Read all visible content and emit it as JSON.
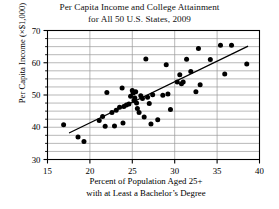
{
  "chart_data": {
    "type": "scatter",
    "title": "Per Capita Income and College Attainment for All 50 U.S. States, 2009",
    "title_line1": "Per Capita Income and College Attainment",
    "title_line2": "for All 50 U.S. States, 2009",
    "xlabel": "Percent of Population Aged 25+ with at Least a Bachelor's Degree",
    "xlabel_line1": "Percent of Population Aged 25+",
    "xlabel_line2": "with at Least a Bachelor’s Degree",
    "ylabel": "Per Capita Income (×$1,000)",
    "xlim": [
      15,
      40
    ],
    "ylim": [
      30,
      70
    ],
    "xticks": [
      15,
      20,
      25,
      30,
      35,
      40
    ],
    "yticks": [
      30,
      40,
      50,
      60,
      70
    ],
    "y_minor_ticks": [
      32.5,
      35,
      37.5,
      42.5,
      45,
      47.5,
      52.5,
      55,
      57.5,
      62.5,
      65,
      67.5
    ],
    "grid": "horizontal-minor-and-major plus vertical at major x ticks",
    "legend": "none",
    "marker": "filled-circle",
    "marker_color": "#000000",
    "frame_color": "#000000",
    "grid_color": "#9a9a9a",
    "points": [
      [
        16.9,
        40.8
      ],
      [
        18.6,
        37.0
      ],
      [
        19.3,
        35.6
      ],
      [
        21.1,
        42.1
      ],
      [
        21.5,
        43.3
      ],
      [
        21.8,
        40.3
      ],
      [
        22.0,
        50.8
      ],
      [
        22.6,
        44.6
      ],
      [
        22.9,
        40.4
      ],
      [
        23.1,
        45.3
      ],
      [
        23.5,
        46.2
      ],
      [
        23.8,
        52.2
      ],
      [
        23.9,
        41.3
      ],
      [
        24.0,
        46.4
      ],
      [
        24.3,
        46.9
      ],
      [
        24.6,
        47.2
      ],
      [
        24.8,
        49.6
      ],
      [
        25.0,
        51.4
      ],
      [
        25.1,
        50.6
      ],
      [
        25.2,
        48.3
      ],
      [
        25.3,
        49.1
      ],
      [
        25.4,
        51.0
      ],
      [
        25.5,
        47.5
      ],
      [
        25.6,
        45.8
      ],
      [
        25.8,
        44.6
      ],
      [
        26.0,
        49.8
      ],
      [
        26.2,
        48.9
      ],
      [
        26.4,
        43.2
      ],
      [
        26.6,
        61.2
      ],
      [
        26.8,
        49.3
      ],
      [
        27.0,
        47.4
      ],
      [
        27.2,
        41.0
      ],
      [
        27.4,
        50.1
      ],
      [
        28.0,
        42.3
      ],
      [
        28.6,
        49.9
      ],
      [
        29.0,
        59.4
      ],
      [
        29.2,
        50.3
      ],
      [
        29.5,
        45.5
      ],
      [
        30.3,
        54.0
      ],
      [
        30.6,
        56.3
      ],
      [
        30.8,
        53.5
      ],
      [
        31.0,
        54.0
      ],
      [
        31.4,
        61.1
      ],
      [
        31.9,
        57.3
      ],
      [
        32.5,
        51.0
      ],
      [
        32.8,
        64.4
      ],
      [
        33.0,
        53.2
      ],
      [
        34.2,
        61.0
      ],
      [
        35.4,
        65.4
      ],
      [
        35.9,
        56.5
      ],
      [
        36.7,
        65.4
      ],
      [
        38.5,
        59.6
      ]
    ],
    "trendline": {
      "x1": 17.6,
      "y1": 38.3,
      "x2": 38.6,
      "y2": 65.1,
      "color": "#000000"
    }
  }
}
